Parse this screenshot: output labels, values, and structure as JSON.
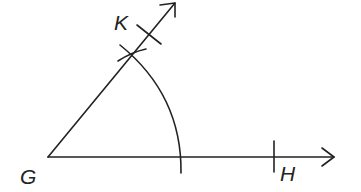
{
  "diagram": {
    "points": {
      "G": {
        "label": "G",
        "x": 48,
        "y": 157
      },
      "K": {
        "label": "K",
        "x": 150,
        "y": 34
      },
      "H": {
        "label": "H",
        "x": 274,
        "y": 157
      }
    },
    "labels": {
      "G": "G",
      "K": "K",
      "H": "H"
    },
    "rays": [
      {
        "name": "ray-GH",
        "from": "G",
        "direction": "horizontal-right",
        "arrow": true
      },
      {
        "name": "ray-GK",
        "from": "G",
        "direction": "up-right",
        "arrow": true
      }
    ],
    "arcs": [
      {
        "name": "compass-arc",
        "center": "G",
        "description": "arc from ray GK intersection down to ray GH"
      }
    ],
    "tick_marks": [
      {
        "name": "tick-H",
        "on": "ray-GH"
      },
      {
        "name": "tick-K",
        "on": "ray-GK"
      },
      {
        "name": "tick-arc-intersection",
        "on": "ray-GK"
      }
    ],
    "stroke_color": "#222222",
    "background_color": "#ffffff"
  }
}
